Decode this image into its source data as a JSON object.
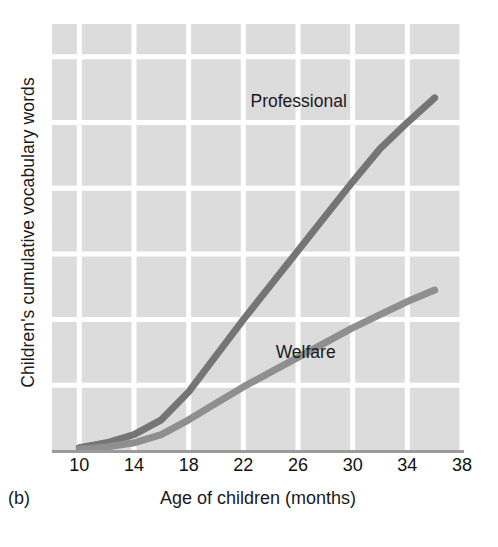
{
  "panel": {
    "letter": "(b)"
  },
  "chart_data": {
    "type": "line",
    "title": "",
    "xlabel": "Age of children (months)",
    "ylabel": "Children's cumulative vocabulary words",
    "xlim": [
      8,
      38
    ],
    "ylim": [
      0,
      1300
    ],
    "grid": true,
    "legend_position": "inline-labels",
    "xticks": [
      10,
      14,
      18,
      22,
      26,
      30,
      34,
      38
    ],
    "xtick_labels": [
      "10",
      "14",
      "18",
      "22",
      "26",
      "30",
      "34",
      "38"
    ],
    "yticks": [
      200,
      400,
      600,
      800,
      1000,
      1200
    ],
    "ytick_labels": [
      "200",
      "400",
      "600",
      "800",
      "1,000",
      "1,200"
    ],
    "series": [
      {
        "name": "Professional",
        "color": "#757575",
        "label_text": "Professional",
        "x": [
          10,
          12,
          14,
          16,
          18,
          20,
          22,
          24,
          26,
          28,
          30,
          32,
          34,
          36
        ],
        "values": [
          10,
          25,
          50,
          95,
          180,
          290,
          400,
          505,
          610,
          715,
          820,
          920,
          1000,
          1075
        ]
      },
      {
        "name": "Welfare",
        "color": "#8f8f8f",
        "label_text": "Welfare",
        "x": [
          10,
          12,
          14,
          16,
          18,
          20,
          22,
          24,
          26,
          28,
          30,
          32,
          34,
          36
        ],
        "values": [
          5,
          12,
          25,
          50,
          95,
          145,
          195,
          240,
          285,
          330,
          375,
          415,
          455,
          490
        ]
      }
    ],
    "annotations": [
      {
        "text": "Professional",
        "x": 27.5,
        "y": 1065
      },
      {
        "text": "Welfare",
        "x": 27.0,
        "y": 300
      }
    ],
    "colors": {
      "plot_background": "#dcdcdc",
      "gridline": "#ffffff",
      "axis_line": "#9a9a9a",
      "text": "#1a1a1a"
    }
  }
}
